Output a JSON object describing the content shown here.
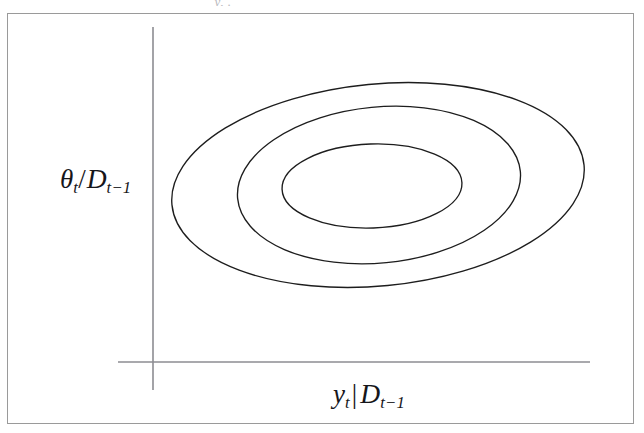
{
  "figure": {
    "domain": "diagram",
    "background_color": "#ffffff",
    "frame_color": "#9a9a9a",
    "axis_color": "#8c8c92",
    "contour_color": "#1d1d1d",
    "top_fragment_text": "y, ."
  },
  "axes": {
    "y_axis": {
      "name": "theta-over-D",
      "label_parts": {
        "symbol": "θ",
        "symbol_sub": "t",
        "separator": "/",
        "conditional": "D",
        "conditional_sub": "t−1"
      },
      "label_text": "θt / Dt−1",
      "x_px": 153,
      "y_top_px": 27,
      "y_bottom_px": 390
    },
    "x_axis": {
      "name": "y-given-D",
      "label_parts": {
        "symbol": "y",
        "symbol_sub": "t",
        "separator": "|",
        "conditional": "D",
        "conditional_sub": "t−1"
      },
      "label_text": "yt | Dt−1",
      "y_px": 362,
      "x_left_px": 118,
      "x_right_px": 590
    }
  },
  "chart_data": {
    "type": "contour",
    "title": "",
    "xlabel": "y_t | D_{t-1}",
    "ylabel": "θ_t / D_{t-1}",
    "grid": false,
    "legend": "none",
    "contours": [
      {
        "name": "outer-contour",
        "level": 1,
        "center_x": 378,
        "center_y": 185,
        "radius_x": 207,
        "radius_y": 101,
        "rotation_deg": -5.5
      },
      {
        "name": "middle-contour",
        "level": 2,
        "center_x": 379,
        "center_y": 185,
        "radius_x": 142,
        "radius_y": 78,
        "rotation_deg": -5.5
      },
      {
        "name": "inner-contour",
        "level": 3,
        "center_x": 372,
        "center_y": 186,
        "radius_x": 90,
        "radius_y": 42,
        "rotation_deg": -2
      }
    ]
  }
}
